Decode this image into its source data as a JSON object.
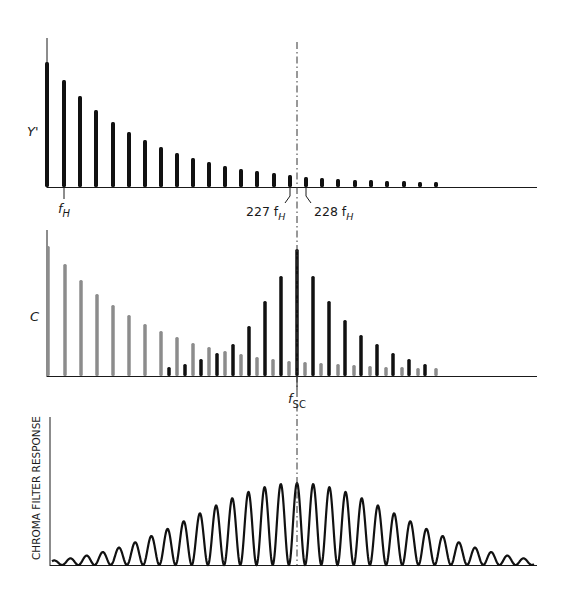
{
  "colors": {
    "luma_bar": "#111111",
    "chroma_bar": "#111111",
    "luma_in_chroma_bar": "#8c8c8c",
    "axis": "#1a1a1a"
  },
  "panels": {
    "luma": {
      "ylabel": "Y'",
      "labels": {
        "fH_main": "f",
        "fH_sub": "H",
        "h227_num": "227 f",
        "h227_sub": "H",
        "h228_num": "228 f",
        "h228_sub": "H"
      },
      "bars": [
        {
          "x": 47,
          "h": 125
        },
        {
          "x": 64,
          "h": 107
        },
        {
          "x": 80,
          "h": 91
        },
        {
          "x": 96,
          "h": 77
        },
        {
          "x": 113,
          "h": 65
        },
        {
          "x": 129,
          "h": 55
        },
        {
          "x": 145,
          "h": 47
        },
        {
          "x": 161,
          "h": 40
        },
        {
          "x": 177,
          "h": 34
        },
        {
          "x": 193,
          "h": 29
        },
        {
          "x": 209,
          "h": 25
        },
        {
          "x": 225,
          "h": 21
        },
        {
          "x": 241,
          "h": 18
        },
        {
          "x": 257,
          "h": 16
        },
        {
          "x": 274,
          "h": 14
        },
        {
          "x": 290,
          "h": 12
        },
        {
          "x": 306,
          "h": 10
        },
        {
          "x": 322,
          "h": 9
        },
        {
          "x": 338,
          "h": 8
        },
        {
          "x": 355,
          "h": 7
        },
        {
          "x": 371,
          "h": 7
        },
        {
          "x": 387,
          "h": 6
        },
        {
          "x": 404,
          "h": 6
        },
        {
          "x": 420,
          "h": 5
        },
        {
          "x": 436,
          "h": 5
        }
      ]
    },
    "chroma": {
      "ylabel": "C",
      "labels": {
        "fsc_main": "f",
        "fsc_sub": "SC"
      },
      "gray_bars": [
        {
          "x": 48,
          "h": 130
        },
        {
          "x": 65,
          "h": 112
        },
        {
          "x": 81,
          "h": 96
        },
        {
          "x": 97,
          "h": 82
        },
        {
          "x": 113,
          "h": 71
        },
        {
          "x": 129,
          "h": 61
        },
        {
          "x": 145,
          "h": 52
        },
        {
          "x": 161,
          "h": 45
        },
        {
          "x": 177,
          "h": 39
        },
        {
          "x": 193,
          "h": 33
        },
        {
          "x": 209,
          "h": 29
        },
        {
          "x": 225,
          "h": 25
        },
        {
          "x": 241,
          "h": 22
        },
        {
          "x": 257,
          "h": 19
        },
        {
          "x": 273,
          "h": 17
        },
        {
          "x": 289,
          "h": 15
        },
        {
          "x": 305,
          "h": 14
        },
        {
          "x": 321,
          "h": 13
        },
        {
          "x": 338,
          "h": 12
        },
        {
          "x": 354,
          "h": 11
        },
        {
          "x": 370,
          "h": 10
        },
        {
          "x": 386,
          "h": 9
        },
        {
          "x": 402,
          "h": 9
        },
        {
          "x": 418,
          "h": 8
        },
        {
          "x": 436,
          "h": 8
        }
      ],
      "black_bars": [
        {
          "x": 169,
          "h": 9
        },
        {
          "x": 185,
          "h": 12
        },
        {
          "x": 201,
          "h": 17
        },
        {
          "x": 217,
          "h": 23
        },
        {
          "x": 233,
          "h": 32
        },
        {
          "x": 249,
          "h": 50
        },
        {
          "x": 265,
          "h": 75
        },
        {
          "x": 281,
          "h": 100
        },
        {
          "x": 297,
          "h": 127
        },
        {
          "x": 313,
          "h": 100
        },
        {
          "x": 329,
          "h": 75
        },
        {
          "x": 345,
          "h": 56
        },
        {
          "x": 361,
          "h": 41
        },
        {
          "x": 377,
          "h": 32
        },
        {
          "x": 393,
          "h": 23
        },
        {
          "x": 409,
          "h": 17
        },
        {
          "x": 425,
          "h": 12
        }
      ]
    },
    "filter": {
      "ylabel": "CHROMA FILTER RESPONSE",
      "peak_spacing": 16.2,
      "center_x": 297,
      "max_amplitude": 82
    }
  },
  "chart_data": {
    "type": "bar",
    "title": "",
    "panels": [
      {
        "name": "Y'",
        "series": [
          {
            "name": "luma harmonics",
            "values": [
              125,
              107,
              91,
              77,
              65,
              55,
              47,
              40,
              34,
              29,
              25,
              21,
              18,
              16,
              14,
              12,
              10,
              9,
              8,
              7,
              7,
              6,
              6,
              5,
              5
            ]
          }
        ]
      },
      {
        "name": "C",
        "series": [
          {
            "name": "luma (gray)",
            "values": [
              130,
              112,
              96,
              82,
              71,
              61,
              52,
              45,
              39,
              33,
              29,
              25,
              22,
              19,
              17,
              15,
              14,
              13,
              12,
              11,
              10,
              9,
              9,
              8,
              8
            ]
          },
          {
            "name": "chroma (black)",
            "values": [
              9,
              12,
              17,
              23,
              32,
              50,
              75,
              100,
              127,
              100,
              75,
              56,
              41,
              32,
              23,
              17,
              12
            ]
          }
        ]
      },
      {
        "name": "CHROMA FILTER RESPONSE",
        "type": "line",
        "description": "comb-like response peaking at fsc"
      }
    ],
    "annotations": [
      "f_H",
      "227 f_H",
      "228 f_H",
      "f_SC"
    ]
  }
}
